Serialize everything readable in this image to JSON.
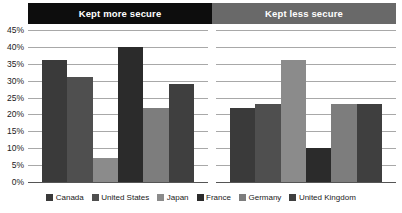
{
  "banners": [
    {
      "label": "Kept more secure",
      "color": "#0d0d0d"
    },
    {
      "label": "Kept less secure",
      "color": "#696969"
    }
  ],
  "legend": [
    {
      "label": "Canada",
      "color": "#3a3a3a"
    },
    {
      "label": "United States",
      "color": "#4f4f4f"
    },
    {
      "label": "Japan",
      "color": "#8b8b8b"
    },
    {
      "label": "France",
      "color": "#2b2b2b"
    },
    {
      "label": "Germany",
      "color": "#7d7d7d"
    },
    {
      "label": "United Kingdom",
      "color": "#3f3f3f"
    }
  ],
  "axis": {
    "ticks": [
      "45%",
      "40%",
      "35%",
      "30%",
      "25%",
      "20%",
      "15%",
      "10%",
      "5%",
      "0%"
    ],
    "min": 0,
    "max": 45,
    "step": 5
  },
  "chart_data": {
    "type": "bar",
    "title": "",
    "xlabel": "",
    "ylabel": "",
    "ylim": [
      0,
      45
    ],
    "grid": true,
    "legend_position": "bottom",
    "groups": [
      "Kept more secure",
      "Kept less secure"
    ],
    "categories": [
      "Canada",
      "United States",
      "Japan",
      "France",
      "Germany",
      "United Kingdom"
    ],
    "series": [
      {
        "name": "Kept more secure",
        "values": [
          36,
          31,
          7,
          40,
          22,
          29
        ]
      },
      {
        "name": "Kept less secure",
        "values": [
          22,
          23,
          36,
          10,
          23,
          23
        ]
      }
    ]
  }
}
